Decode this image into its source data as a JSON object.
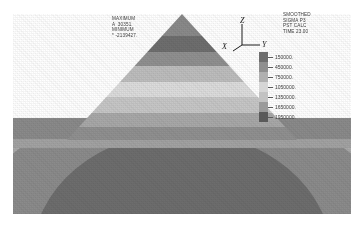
{
  "figure": {
    "type": "fea-contour-plot",
    "title_block": {
      "line1": "SMOOTHED",
      "line2": "SIGMA P3",
      "line3": "PST CALC",
      "line4": "TIME 23.00"
    },
    "extremes": {
      "max_label": "MAXIMUM",
      "max_symbol": "A",
      "max_value": "30351.",
      "min_label": "MINIMUM",
      "min_symbol": "*",
      "min_value": "-2139427."
    },
    "axes": {
      "z": "Z",
      "y": "Y",
      "x": "X"
    }
  },
  "chart_data": {
    "type": "heatmap",
    "title": "SMOOTHED SIGMA P3",
    "subtitle": "PST CALC  TIME 23.00",
    "xlabel": "Y",
    "ylabel": "Z",
    "zlabel": "X",
    "grid": false,
    "legend_position": "right",
    "quantity": "SIGMA P3",
    "units": "",
    "contour_levels": [
      150000,
      450000,
      750000,
      1050000,
      1350000,
      1650000,
      1950000
    ],
    "contour_level_labels": [
      "150000.",
      "450000.",
      "750000.",
      "1050000.",
      "1350000.",
      "1650000.",
      "1950000."
    ],
    "contour_interval": 300000,
    "level_colors": [
      "#6e6e6e",
      "#8f8f8f",
      "#b0b0b0",
      "#d6d6d6",
      "#c2c2c2",
      "#9a9a9a",
      "#5a5a5a"
    ],
    "data_min": -2139427,
    "data_max": 30351,
    "annotations": [
      {
        "text": "MAXIMUM A 30351.",
        "x": 0.33,
        "y": 0.08
      },
      {
        "text": "MINIMUM * -2139427.",
        "x": 0.33,
        "y": 0.17
      }
    ]
  },
  "legend": {
    "rows": [
      {
        "color": "#6e6e6e",
        "value": "150000."
      },
      {
        "color": "#8f8f8f",
        "value": "450000."
      },
      {
        "color": "#b0b0b0",
        "value": "750000."
      },
      {
        "color": "#d6d6d6",
        "value": "1050000."
      },
      {
        "color": "#c2c2c2",
        "value": "1350000."
      },
      {
        "color": "#9a9a9a",
        "value": "1650000."
      },
      {
        "color": "#5a5a5a",
        "value": "1950000."
      }
    ]
  }
}
